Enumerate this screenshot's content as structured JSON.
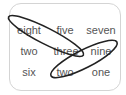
{
  "puzzle": {
    "grid": [
      [
        "eight",
        "five",
        "seven"
      ],
      [
        "two",
        "three",
        "nine"
      ],
      [
        "six",
        "two",
        "one"
      ]
    ],
    "loops": [
      {
        "from": "eight",
        "to": "three",
        "color": "#222222"
      },
      {
        "from": "nine",
        "to": "two",
        "color": "#222222"
      }
    ],
    "colors": {
      "text": "#555555",
      "border": "#d4d4d4",
      "loop": "#222222"
    }
  }
}
